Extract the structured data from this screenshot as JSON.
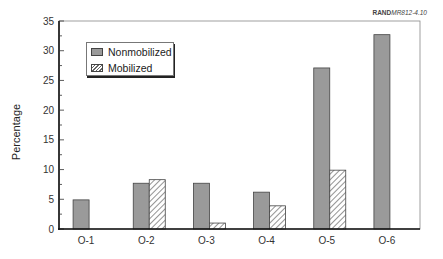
{
  "credit": {
    "bold": "RAND",
    "italic": "MR812-4.10"
  },
  "chart_data": {
    "type": "bar",
    "title": "",
    "xlabel": "",
    "ylabel": "Percentage",
    "ylim": [
      0,
      35
    ],
    "yticks": [
      0,
      5,
      10,
      15,
      20,
      25,
      30,
      35
    ],
    "grid": false,
    "legend_position": "upper left",
    "categories": [
      "O-1",
      "O-2",
      "O-3",
      "O-4",
      "O-5",
      "O-6"
    ],
    "series": [
      {
        "name": "Nonmobilized",
        "style": "solid gray",
        "color": "#9a9a9a",
        "values": [
          4.9,
          7.7,
          7.7,
          6.2,
          27.1,
          32.7
        ]
      },
      {
        "name": "Mobilized",
        "style": "hatched",
        "color": "#ffffff",
        "values": [
          0,
          8.3,
          1.0,
          3.9,
          9.9,
          0
        ]
      }
    ]
  },
  "legend": {
    "items": [
      "Nonmobilized",
      "Mobilized"
    ]
  }
}
